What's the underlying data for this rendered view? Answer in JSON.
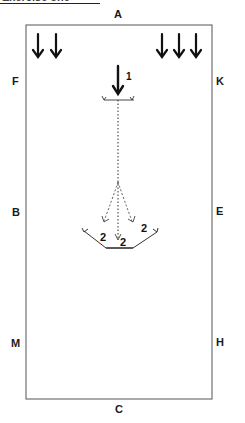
{
  "title": {
    "text": "Exercise one"
  },
  "arena": {
    "letters": {
      "A": "A",
      "C": "C",
      "F": "F",
      "K": "K",
      "B": "B",
      "E": "E",
      "M": "M",
      "H": "H"
    }
  },
  "diagram": {
    "step_1_label": "1",
    "step_2_labels": [
      "2",
      "2",
      "2"
    ],
    "entry_arrows_left_count": 2,
    "entry_arrows_right_count": 3
  },
  "colors": {
    "line": "#1a1a1a",
    "border": "#555555",
    "background": "#ffffff"
  }
}
